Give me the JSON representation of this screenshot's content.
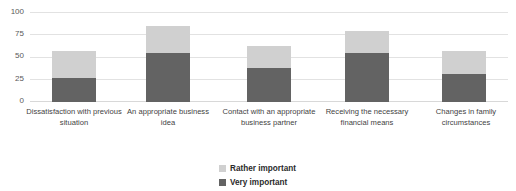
{
  "chart_data": {
    "type": "bar",
    "subtype": "stacked-vertical",
    "title": "",
    "xlabel": "",
    "ylabel": "",
    "ylim": [
      0,
      100
    ],
    "yticks": [
      0,
      25,
      50,
      75,
      100
    ],
    "grid": true,
    "legend_position": "bottom-center",
    "categories": [
      "Dissatisfaction with previous situation",
      "An appropriate business idea",
      "Contact with an appropriate business partner",
      "Receiving the necessary financial means",
      "Changes in family circumstances"
    ],
    "series": [
      {
        "name": "Very important",
        "color": "#636363",
        "values": [
          27,
          55,
          38,
          55,
          31
        ]
      },
      {
        "name": "Rather important",
        "color": "#d0d0d0",
        "values": [
          30,
          30,
          25,
          25,
          26
        ]
      }
    ],
    "totals": [
      57,
      85,
      63,
      80,
      57
    ]
  },
  "axis": {
    "y_tick_labels": [
      "100",
      "75",
      "50",
      "25",
      "0"
    ]
  },
  "legend": {
    "items": [
      {
        "label": "Rather important",
        "swatch": "rather"
      },
      {
        "label": "Very important",
        "swatch": "very"
      }
    ]
  }
}
